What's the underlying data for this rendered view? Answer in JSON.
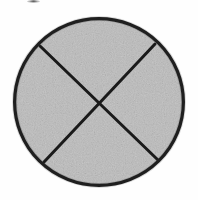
{
  "figure": {
    "background_color": "#fefefe",
    "caption": "",
    "artifact": {
      "name": "scan-smudge",
      "description": "faint dark scan artifact at top edge",
      "x": 27,
      "y": 0,
      "width": 13,
      "height": 3,
      "color": "#282828"
    }
  },
  "chart_data": {
    "type": "pie",
    "subtitle": "",
    "xlabel": "",
    "ylabel": "",
    "categories": [
      "top-sector",
      "right-sector",
      "bottom-sector",
      "left-sector"
    ],
    "values": [
      25,
      25,
      25,
      25
    ],
    "labels": [],
    "legend": [],
    "legend_position": "none",
    "grid": false,
    "fill_color": "#bdbdbd",
    "fill_texture": "speckled-grain",
    "outline_color": "#1a1a1a",
    "outline_width": 3.2,
    "divider_color": "#1a1a1a",
    "divider_width": 3.0,
    "circle": {
      "center_x": 99,
      "center_y": 102,
      "radius_x": 86,
      "radius_y": 85
    },
    "dividers": [
      {
        "name": "chord-upper-left-to-lower-right",
        "x1": 40,
        "y1": 46,
        "x2": 158,
        "y2": 160
      },
      {
        "name": "chord-upper-right-to-lower-left",
        "x1": 155,
        "y1": 44,
        "x2": 44,
        "y2": 162
      }
    ],
    "intersection": {
      "x": 99,
      "y": 102
    }
  }
}
